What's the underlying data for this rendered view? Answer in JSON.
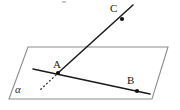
{
  "figure": {
    "kind": "solid-geometry-diagram",
    "background_color": "#ffffff",
    "stroke_color": "#1a1a1a",
    "plane_stroke_color": "#8c8c8c",
    "dotted_stroke_color": "#3a3a3a",
    "labels": {
      "point_a": "A",
      "point_b": "B",
      "point_c": "C",
      "plane_alpha": "α"
    },
    "geometry": {
      "plane": {
        "name": "alpha",
        "vertices": [
          {
            "x": 28,
            "y": 47
          },
          {
            "x": 168,
            "y": 47
          },
          {
            "x": 152,
            "y": 99
          },
          {
            "x": 9,
            "y": 99
          }
        ]
      },
      "line_ac": {
        "from": {
          "x": 58,
          "y": 73
        },
        "to": {
          "x": 133,
          "y": 5
        }
      },
      "line_ab": {
        "from": {
          "x": 33,
          "y": 69
        },
        "to": {
          "x": 150,
          "y": 94
        }
      },
      "dotted_segment": {
        "from": {
          "x": 56,
          "y": 75
        },
        "to": {
          "x": 40,
          "y": 90
        }
      },
      "points": {
        "a": {
          "x": 58,
          "y": 73,
          "radius": 2.1
        },
        "b": {
          "x": 137,
          "y": 91,
          "radius": 2.1
        },
        "c": {
          "x": 122,
          "y": 19,
          "radius": 2.1
        }
      },
      "label_positions": {
        "a": {
          "x": 53,
          "y": 59
        },
        "b": {
          "x": 127,
          "y": 75
        },
        "c": {
          "x": 110,
          "y": 3
        },
        "alpha": {
          "x": 15,
          "y": 84
        }
      },
      "speck": {
        "x": 62,
        "y": 1,
        "width": 4,
        "height": 2,
        "color": "#c9c9c9"
      }
    }
  }
}
